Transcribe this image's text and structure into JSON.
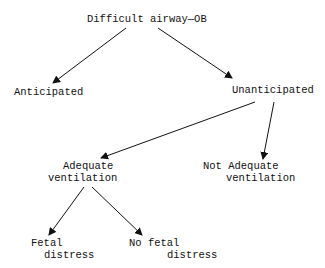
{
  "diagram": {
    "type": "tree",
    "root": {
      "label": "Difficult airway—OB",
      "children": [
        {
          "label": "Anticipated"
        },
        {
          "label": "Unanticipated",
          "children": [
            {
              "label_line1": "Adequate",
              "label_line2": "ventilation",
              "children": [
                {
                  "label_line1": "Fetal",
                  "label_line2": "distress"
                },
                {
                  "label_line1": "No fetal",
                  "label_line2": "distress"
                }
              ]
            },
            {
              "label_line1": "Not Adequate",
              "label_line2": "ventilation"
            }
          ]
        }
      ]
    },
    "colors": {
      "line": "#111111",
      "text": "#111111",
      "background": "#ffffff"
    }
  }
}
